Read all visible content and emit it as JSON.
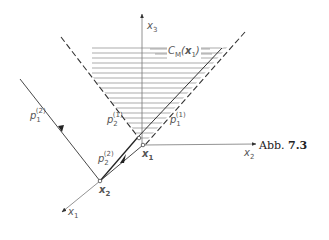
{
  "figure": {
    "caption_prefix": "Abb.",
    "caption_number": "7.3",
    "axes": {
      "x1": {
        "symbol": "x",
        "index": "1"
      },
      "x2": {
        "symbol": "x",
        "index": "2"
      },
      "x3": {
        "symbol": "x",
        "index": "3"
      }
    },
    "points": {
      "x1": {
        "symbol": "x",
        "index": "1"
      },
      "x2": {
        "symbol": "x",
        "index": "2"
      }
    },
    "cone_label": {
      "symbol": "C",
      "subscript": "M",
      "argument": "x",
      "argument_index": "1"
    },
    "vectors": {
      "p1_1": {
        "symbol": "p",
        "sub": "1",
        "sup": "(1)"
      },
      "p2_1": {
        "symbol": "p",
        "sub": "2",
        "sup": "(1)"
      },
      "p1_2": {
        "symbol": "p",
        "sub": "1",
        "sup": "(2)"
      },
      "p2_2": {
        "symbol": "p",
        "sub": "2",
        "sup": "(2)"
      }
    },
    "colors": {
      "line": "#333333",
      "hatch": "#888888",
      "axis": "#777777"
    }
  }
}
